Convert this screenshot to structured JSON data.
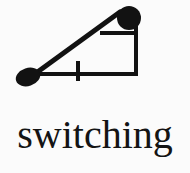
{
  "caption": {
    "text": "switching"
  },
  "colors": {
    "background": "#fbfbfb",
    "ink": "#121212",
    "text": "#141414"
  },
  "figure": {
    "title": "switching",
    "type": "line-diagram",
    "elements": {
      "left_blob": {
        "name": "left-blob",
        "shape": "ellipse",
        "cx": 28,
        "cy": 77,
        "rx": 12,
        "ry": 9,
        "rotation": -18
      },
      "top_right_node": {
        "name": "top-right-node",
        "shape": "circle",
        "cx": 129,
        "cy": 18,
        "r": 12
      },
      "diagonal_arm": {
        "name": "diagonal-arm",
        "x1": 32,
        "y1": 76,
        "x2": 120,
        "y2": 12,
        "stroke_width": 5
      },
      "baseline": {
        "name": "baseline",
        "x1": 35,
        "y1": 74,
        "x2": 137,
        "y2": 74,
        "stroke_width": 4
      },
      "right_edge": {
        "name": "right-edge",
        "x1": 136,
        "y1": 24,
        "x2": 136,
        "y2": 75,
        "stroke_width": 4
      },
      "top_crossbar": {
        "name": "top-crossbar",
        "x1": 101,
        "y1": 33,
        "x2": 137,
        "y2": 33,
        "stroke_width": 4
      },
      "baseline_tick": {
        "name": "baseline-tick",
        "x1": 78,
        "y1": 61,
        "x2": 78,
        "y2": 81,
        "stroke_width": 4
      }
    }
  }
}
